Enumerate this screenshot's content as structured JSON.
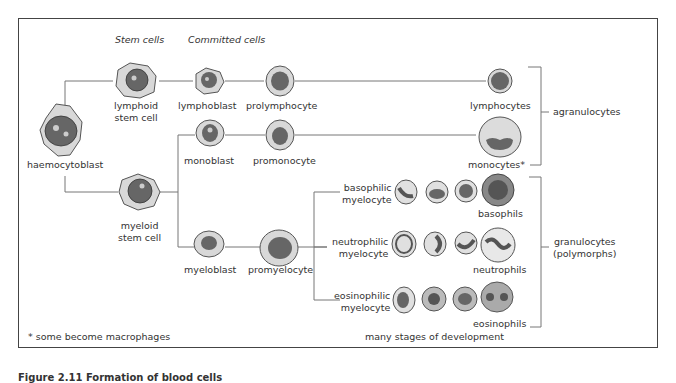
{
  "headers": {
    "stem_cells": "Stem cells",
    "committed_cells": "Committed cells"
  },
  "cells": {
    "haemocytoblast": "haemocytoblast",
    "lymphoid_stem_cell": [
      "lymphoid",
      "stem cell"
    ],
    "myeloid_stem_cell": [
      "myeloid",
      "stem cell"
    ],
    "lymphoblast": "lymphoblast",
    "prolymphocyte": "prolymphocyte",
    "lymphocytes": "lymphocytes",
    "monoblast": "monoblast",
    "promonocyte": "promonocyte",
    "monocytes": "monocytes*",
    "myeloblast": "myeloblast",
    "promyelocyte": "promyelocyte",
    "basophilic_myelocyte": [
      "basophilic",
      "myelocyte"
    ],
    "neutrophilic_myelocyte": [
      "neutrophilic",
      "myelocyte"
    ],
    "eosinophilic_myelocyte": [
      "eosinophilic",
      "myelocyte"
    ],
    "basophils": "basophils",
    "neutrophils": "neutrophils",
    "eosinophils": "eosinophils"
  },
  "groups": {
    "agranulocytes": "agranulocytes",
    "granulocytes": [
      "granulocytes",
      "(polymorphs)"
    ]
  },
  "notes": {
    "footnote": "* some become macrophages",
    "stages": "many stages of development"
  },
  "caption": "Figure 2.11 Formation of blood cells"
}
